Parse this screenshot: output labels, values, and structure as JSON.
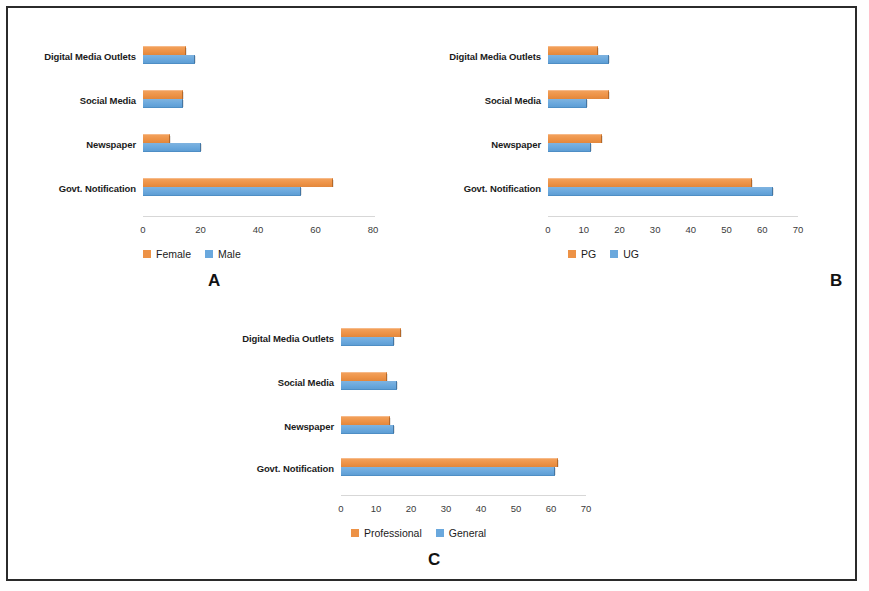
{
  "figure": {
    "background": "#ffffff",
    "border_color": "#2a2a2a",
    "series_colors": {
      "orange": "#ed9246",
      "blue": "#6aa8dd"
    }
  },
  "panels": [
    {
      "letter": "A",
      "legend": [
        "Female",
        "Male"
      ],
      "categories": [
        "Digital Media Outlets",
        "Social Media",
        "Newspaper",
        "Govt. Notification"
      ],
      "ticks": [
        "0",
        "20",
        "40",
        "60",
        "80"
      ]
    },
    {
      "letter": "B",
      "legend": [
        "PG",
        "UG"
      ],
      "categories": [
        "Digital Media Outlets",
        "Social Media",
        "Newspaper",
        "Govt. Notification"
      ],
      "ticks": [
        "0",
        "10",
        "20",
        "30",
        "40",
        "50",
        "60",
        "70"
      ]
    },
    {
      "letter": "C",
      "legend": [
        "Professional",
        "General"
      ],
      "categories": [
        "Digital Media Outlets",
        "Social Media",
        "Newspaper",
        "Govt. Notification"
      ],
      "ticks": [
        "0",
        "10",
        "20",
        "30",
        "40",
        "50",
        "60",
        "70"
      ]
    }
  ],
  "chart_data": [
    {
      "type": "bar",
      "orientation": "horizontal",
      "panel": "A",
      "title": "A",
      "xlabel": "",
      "ylabel": "",
      "categories": [
        "Digital Media Outlets",
        "Social Media",
        "Newspaper",
        "Govt. Notification"
      ],
      "series": [
        {
          "name": "Female",
          "color": "#ed9246",
          "values": [
            15,
            14,
            9.5,
            66
          ]
        },
        {
          "name": "Male",
          "color": "#6aa8dd",
          "values": [
            18,
            14,
            20,
            55
          ]
        }
      ],
      "xlim": [
        0,
        80
      ],
      "xticks": [
        0,
        20,
        40,
        60,
        80
      ],
      "grid": false,
      "legend_position": "bottom"
    },
    {
      "type": "bar",
      "orientation": "horizontal",
      "panel": "B",
      "title": "B",
      "xlabel": "",
      "ylabel": "",
      "categories": [
        "Digital Media Outlets",
        "Social Media",
        "Newspaper",
        "Govt. Notification"
      ],
      "series": [
        {
          "name": "PG",
          "color": "#ed9246",
          "values": [
            14,
            17,
            15,
            57
          ]
        },
        {
          "name": "UG",
          "color": "#6aa8dd",
          "values": [
            17,
            11,
            12,
            63
          ]
        }
      ],
      "xlim": [
        0,
        70
      ],
      "xticks": [
        0,
        10,
        20,
        30,
        40,
        50,
        60,
        70
      ],
      "grid": false,
      "legend_position": "bottom"
    },
    {
      "type": "bar",
      "orientation": "horizontal",
      "panel": "C",
      "title": "C",
      "xlabel": "",
      "ylabel": "",
      "categories": [
        "Digital Media Outlets",
        "Social Media",
        "Newspaper",
        "Govt. Notification"
      ],
      "series": [
        {
          "name": "Professional",
          "color": "#ed9246",
          "values": [
            17,
            13,
            14,
            62
          ]
        },
        {
          "name": "General",
          "color": "#6aa8dd",
          "values": [
            15,
            16,
            15,
            61
          ]
        }
      ],
      "xlim": [
        0,
        70
      ],
      "xticks": [
        0,
        10,
        20,
        30,
        40,
        50,
        60,
        70
      ],
      "grid": false,
      "legend_position": "bottom"
    }
  ]
}
